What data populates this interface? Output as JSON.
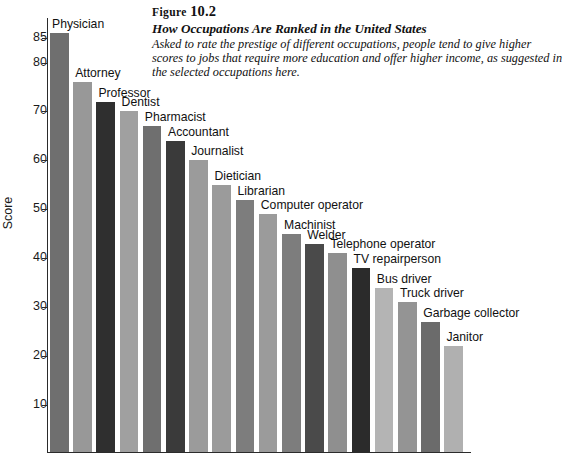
{
  "figure": {
    "label_prefix": "Figure",
    "number": "10.2",
    "title": "How Occupations Are Ranked in the United States",
    "description": "Asked to rate the prestige of different occupations, people tend to give higher scores to jobs that require more education and offer higher income, as suggested in the selected occupations here."
  },
  "chart_data": {
    "type": "bar",
    "title": "How Occupations Are Ranked in the United States",
    "xlabel": "",
    "ylabel": "Score",
    "ylim": [
      0,
      89
    ],
    "grid": false,
    "legend": "none",
    "yticks": [
      85,
      80,
      70,
      60,
      50,
      40,
      30,
      20,
      10
    ],
    "categories": [
      "Physician",
      "Attorney",
      "Professor",
      "Dentist",
      "Pharmacist",
      "Accountant",
      "Journalist",
      "Dietician",
      "Librarian",
      "Computer operator",
      "Machinist",
      "Welder",
      "Telephone operator",
      "TV repairperson",
      "Bus driver",
      "Truck driver",
      "Garbage collector",
      "Janitor"
    ],
    "values": [
      86,
      76,
      72,
      70,
      67,
      64,
      60,
      55,
      52,
      49,
      45,
      43,
      41,
      38,
      34,
      31,
      27,
      22
    ],
    "bar_colors": [
      "#6f6f6f",
      "#989898",
      "#2f2f2f",
      "#a0a0a0",
      "#6f6f6f",
      "#3a3a3a",
      "#9b9b9b",
      "#9b9b9b",
      "#7d7d7d",
      "#9b9b9b",
      "#7d7d7d",
      "#4a4a4a",
      "#8f8f8f",
      "#2b2b2b",
      "#b4b4b4",
      "#949494",
      "#6b6b6b",
      "#b0b0b0"
    ]
  }
}
